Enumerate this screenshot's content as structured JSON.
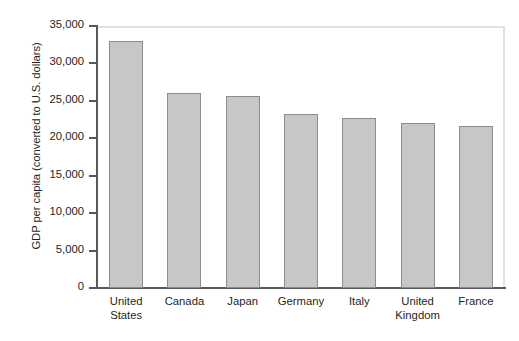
{
  "chart_data": {
    "type": "bar",
    "title": "",
    "xlabel": "",
    "ylabel": "GDP per capita (converted to U.S. dollars)",
    "categories": [
      "United States",
      "Canada",
      "Japan",
      "Germany",
      "Italy",
      "United Kingdom",
      "France"
    ],
    "category_lines": [
      [
        "United",
        "States"
      ],
      [
        "Canada"
      ],
      [
        "Japan"
      ],
      [
        "Germany"
      ],
      [
        "Italy"
      ],
      [
        "United",
        "Kingdom"
      ],
      [
        "France"
      ]
    ],
    "values": [
      33000,
      26000,
      25700,
      23200,
      22700,
      22100,
      21700
    ],
    "ylim": [
      0,
      35000
    ],
    "ytick_values": [
      0,
      5000,
      10000,
      15000,
      20000,
      25000,
      30000,
      35000
    ],
    "ytick_labels": [
      "0",
      "5,000",
      "10,000",
      "15,000",
      "20,000",
      "25,000",
      "30,000",
      "35,000"
    ],
    "grid": false,
    "legend": null,
    "colors": {
      "bar_fill": "#c6c7c9",
      "bar_border": "#8a8c8e",
      "axis": "#58595b",
      "frame": "#e2e2e2",
      "text": "#231f20",
      "background": "#ffffff"
    }
  }
}
